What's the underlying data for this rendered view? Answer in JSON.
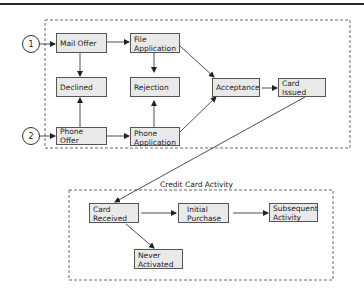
{
  "diagram": {
    "type": "flowchart",
    "entry_points": [
      {
        "id": "1",
        "label": "1"
      },
      {
        "id": "2",
        "label": "2"
      }
    ],
    "acquisition_nodes": {
      "mail_offer": "Mail Offer",
      "file_application": [
        "File",
        "Application"
      ],
      "declined": "Declined",
      "rejection": "Rejection",
      "phone_offer": "Phone Offer",
      "phone_application": [
        "Phone",
        "Application"
      ],
      "acceptance": "Acceptance",
      "card_issued": "Card Issued"
    },
    "activity_section": {
      "title": "Credit Card Activity",
      "card_received": [
        "Card",
        "Received"
      ],
      "initial_purchase": [
        "Initial",
        "Purchase"
      ],
      "subsequent_activity": [
        "Subsequent",
        "Activity"
      ],
      "never_activated": [
        "Never",
        "Activated"
      ]
    },
    "edges": [
      [
        "1",
        "Mail Offer"
      ],
      [
        "2",
        "Phone Offer"
      ],
      [
        "Mail Offer",
        "File Application"
      ],
      [
        "Mail Offer",
        "Declined"
      ],
      [
        "Phone Offer",
        "Declined"
      ],
      [
        "Phone Offer",
        "Phone Application"
      ],
      [
        "File Application",
        "Rejection"
      ],
      [
        "Phone Application",
        "Rejection"
      ],
      [
        "File Application",
        "Acceptance"
      ],
      [
        "Phone Application",
        "Acceptance"
      ],
      [
        "Acceptance",
        "Card Issued"
      ],
      [
        "Card Issued",
        "Card Received"
      ],
      [
        "Card Received",
        "Initial Purchase"
      ],
      [
        "Initial Purchase",
        "Subsequent Activity"
      ],
      [
        "Card Received",
        "Never Activated"
      ]
    ]
  }
}
